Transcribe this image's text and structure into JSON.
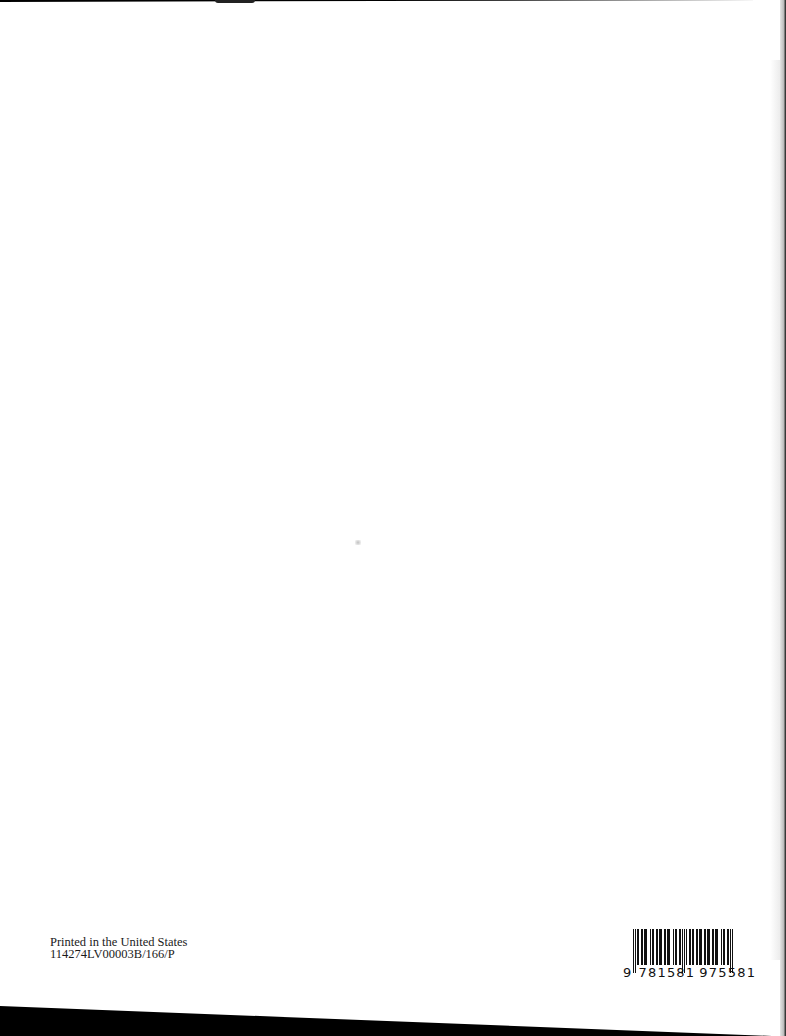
{
  "document": {
    "type": "book-back-page-scan",
    "imprint": {
      "line1": "Printed in the United States",
      "line2": "114274LV00003B/166/P"
    },
    "barcode": {
      "symbology": "EAN-13",
      "lead_digit": "9",
      "group1": "781581",
      "group2": "975581",
      "full_number": "9781581975581"
    }
  },
  "colors": {
    "page": "#ffffff",
    "scan_border": "#000000",
    "text": "#1a1a1a"
  }
}
